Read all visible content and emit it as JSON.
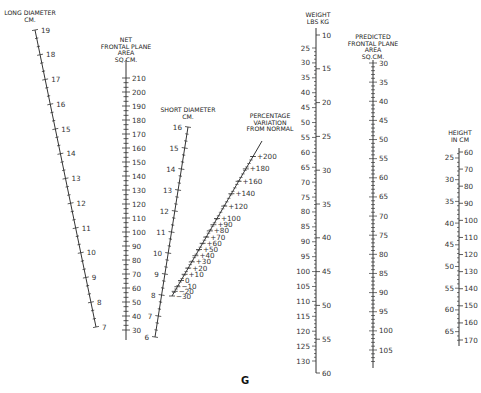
{
  "figure_label": "G",
  "scales": {
    "long_diameter": {
      "title_lines": [
        "LONG DIAMETER",
        "CM."
      ],
      "line": {
        "x1": 35,
        "y1": 30,
        "x2": 96,
        "y2": 327
      },
      "range": [
        19,
        7
      ],
      "major_ticks": [
        19,
        18,
        17,
        16,
        15,
        14,
        13,
        12,
        11,
        10,
        9,
        8,
        7
      ],
      "minor_per_major": 2,
      "label_side": "right"
    },
    "net_frontal_area": {
      "title_lines": [
        "NET",
        "FRONTAL PLANE",
        "AREA",
        "SQ.CM."
      ],
      "line": {
        "x1": 126,
        "y1": 67,
        "x2": 126,
        "y2": 340
      },
      "range": [
        215,
        25
      ],
      "major_ticks": [
        210,
        200,
        190,
        180,
        170,
        160,
        150,
        140,
        130,
        120,
        110,
        100,
        90,
        80,
        70,
        60,
        50,
        40,
        30
      ],
      "minor_per_major": 2,
      "label_side": "right"
    },
    "short_diameter": {
      "title_lines": [
        "SHORT DIAMETER",
        "CM."
      ],
      "line": {
        "x1": 188,
        "y1": 127,
        "x2": 155,
        "y2": 337
      },
      "range": [
        16,
        6
      ],
      "major_ticks": [
        16,
        15,
        14,
        13,
        12,
        11,
        10,
        9,
        8,
        7,
        6
      ],
      "minor_per_major": 2,
      "label_side": "left"
    },
    "percentage_variation": {
      "title_lines": [
        "PERCENTAGE",
        "VARIATION",
        "FROM NORMAL"
      ],
      "line": {
        "x1": 262,
        "y1": 141,
        "x2": 172,
        "y2": 296
      },
      "labels": [
        "+200",
        "+180",
        "+160",
        "+140",
        "+120",
        "+100",
        "+90",
        "+80",
        "+70",
        "+60",
        "+50",
        "+40",
        "+30",
        "+20",
        "+10",
        "0",
        "−10",
        "−20",
        "−30"
      ],
      "label_side": "right"
    },
    "weight": {
      "title_lines": [
        "WEIGHT",
        "LBS  KG"
      ],
      "line": {
        "x1": 316,
        "y1": 28,
        "x2": 316,
        "y2": 373
      },
      "lbs_ticks": [
        25,
        30,
        35,
        40,
        45,
        50,
        55,
        60,
        65,
        70,
        75,
        80,
        85,
        90,
        95,
        100,
        105,
        110,
        115,
        120,
        125,
        130
      ],
      "kg_ticks": [
        10,
        15,
        20,
        25,
        30,
        35,
        40,
        45,
        50,
        55,
        60
      ],
      "lbs_range": [
        18,
        132
      ],
      "kg_range_y": {
        "10": 35,
        "60": 373
      }
    },
    "predicted_frontal_area": {
      "title_lines": [
        "PREDICTED",
        "FRONTAL PLANE",
        "AREA",
        "SQ.CM."
      ],
      "line": {
        "x1": 373,
        "y1": 60,
        "x2": 373,
        "y2": 368
      },
      "major_ticks": [
        30,
        35,
        40,
        45,
        50,
        55,
        60,
        65,
        70,
        75,
        80,
        85,
        90,
        95,
        100,
        105
      ],
      "range_y": {
        "30": 63,
        "105": 350
      },
      "minor_per_major": 5,
      "label_side": "right"
    },
    "height": {
      "title_lines": [
        "HEIGHT",
        "IN  CM"
      ],
      "line": {
        "x1": 459,
        "y1": 148,
        "x2": 459,
        "y2": 346
      },
      "in_ticks": [
        25,
        30,
        35,
        40,
        45,
        50,
        55,
        60,
        65
      ],
      "cm_ticks": [
        60,
        70,
        80,
        90,
        100,
        110,
        120,
        130,
        140,
        150,
        160,
        170
      ],
      "cm_range_y": {
        "60": 152,
        "170": 340
      }
    }
  }
}
